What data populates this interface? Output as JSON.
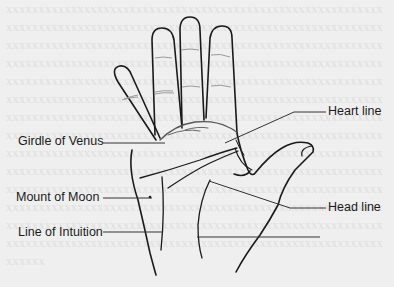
{
  "diagram": {
    "background_text_faded": "palm reading text background",
    "labels": [
      {
        "id": "girdle-of-venus",
        "text": "Girdle of Venus",
        "side": "left"
      },
      {
        "id": "heart-line",
        "text": "Heart line",
        "side": "right"
      },
      {
        "id": "mount-of-moon",
        "text": "Mount of Moon",
        "side": "left"
      },
      {
        "id": "head-line",
        "text": "Head line",
        "side": "right"
      },
      {
        "id": "line-of-intuition",
        "text": "Line of Intuition",
        "side": "left"
      }
    ],
    "colors": {
      "background": "#efefef",
      "outline": "#1a1a1a",
      "leader_line": "#333333",
      "crease": "#9a9a9a"
    }
  }
}
